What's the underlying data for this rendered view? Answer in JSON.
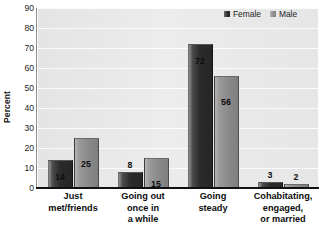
{
  "chart_data": {
    "type": "bar",
    "title": "",
    "subtitle": "",
    "xlabel": "",
    "ylabel": "Percent",
    "ylim": [
      0,
      90
    ],
    "y_ticks": [
      0,
      10,
      20,
      30,
      40,
      50,
      60,
      70,
      80,
      90
    ],
    "grid": true,
    "legend_position": "top-right",
    "categories": [
      "Just\nmet/friends",
      "Going out\nonce in\na while",
      "Going\nsteady",
      "Cohabitating,\nengaged,\nor married"
    ],
    "series": [
      {
        "name": "Female",
        "color": "#2b2b2b",
        "values": [
          14,
          8,
          72,
          3
        ],
        "labels": [
          "14",
          "8",
          "72",
          "3"
        ]
      },
      {
        "name": "Male",
        "color": "#8b8b8b",
        "values": [
          25,
          15,
          56,
          2
        ],
        "labels": [
          "25",
          "15",
          "56",
          "2"
        ]
      }
    ]
  },
  "legend": {
    "items": [
      {
        "label": "Female"
      },
      {
        "label": "Male"
      }
    ]
  },
  "axes": {
    "y_title": "Percent",
    "y_tick_labels": [
      "90",
      "80",
      "70",
      "60",
      "50",
      "40",
      "30",
      "20",
      "10",
      "0"
    ]
  }
}
